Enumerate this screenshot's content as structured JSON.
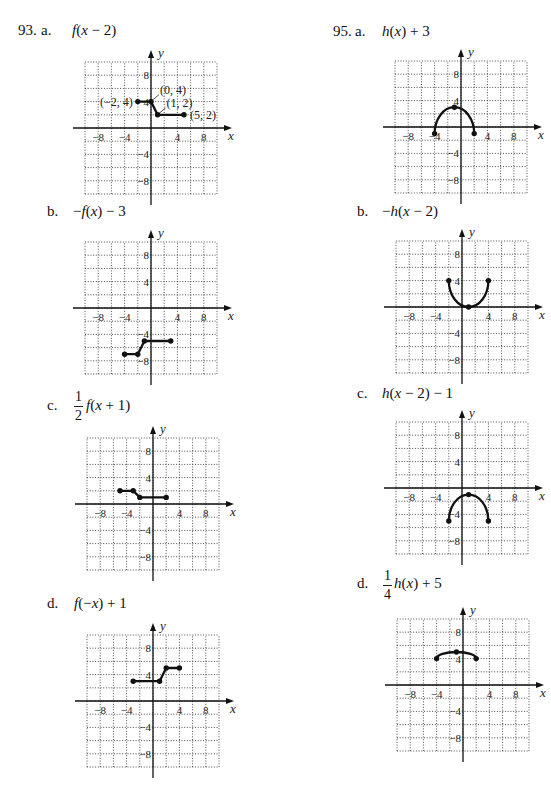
{
  "problems": [
    {
      "number": "93.",
      "parts": [
        {
          "label": "a.",
          "expression": "f(x − 2)"
        },
        {
          "label": "b.",
          "expression": "−f(x) − 3"
        },
        {
          "label": "c.",
          "coefficient": {
            "num": "1",
            "den": "2"
          },
          "expression": "f(x + 1)"
        },
        {
          "label": "d.",
          "expression": "f(−x) + 1"
        }
      ]
    },
    {
      "number": "95.",
      "parts": [
        {
          "label": "a.",
          "expression": "h(x) + 3"
        },
        {
          "label": "b.",
          "expression": "−h(x − 2)"
        },
        {
          "label": "c.",
          "expression": "h(x − 2) − 1"
        },
        {
          "label": "d.",
          "coefficient": {
            "num": "1",
            "den": "4"
          },
          "expression": "h(x) + 5"
        }
      ]
    }
  ],
  "chart_data": [
    {
      "id": "93a",
      "type": "line",
      "title": "f(x − 2)",
      "xlabel": "x",
      "ylabel": "y",
      "xlim": [
        -10,
        10
      ],
      "ylim": [
        -10,
        10
      ],
      "grid": true,
      "grid_step": 2,
      "x_ticks": [
        -8,
        -4,
        4,
        8
      ],
      "x_tick_labels": [
        "−8",
        "−4",
        "4",
        "8"
      ],
      "y_ticks": [
        8,
        4,
        -4,
        -8
      ],
      "y_tick_labels": [
        "8",
        "4",
        "−4",
        "−8"
      ],
      "series": [
        {
          "name": "f(x − 2)",
          "curve": "polyline",
          "points": [
            [
              -2,
              4
            ],
            [
              0,
              4
            ],
            [
              1,
              2
            ],
            [
              5,
              2
            ]
          ]
        }
      ],
      "annotations": [
        {
          "text": "(−2, 4)",
          "x": -2,
          "y": 4,
          "placement": "left"
        },
        {
          "text": "(0, 4)",
          "x": 0,
          "y": 4,
          "placement": "upper-right"
        },
        {
          "text": "(1, 2)",
          "x": 1,
          "y": 2,
          "placement": "upper-right"
        },
        {
          "text": "(5, 2)",
          "x": 5,
          "y": 2,
          "placement": "right"
        }
      ]
    },
    {
      "id": "93b",
      "type": "line",
      "title": "−f(x) − 3",
      "xlabel": "x",
      "ylabel": "y",
      "xlim": [
        -10,
        10
      ],
      "ylim": [
        -10,
        10
      ],
      "grid": true,
      "grid_step": 2,
      "x_ticks": [
        -8,
        -4,
        4,
        8
      ],
      "x_tick_labels": [
        "−8",
        "−4",
        "4",
        "8"
      ],
      "y_ticks": [
        8,
        4,
        -4,
        -8
      ],
      "y_tick_labels": [
        "8",
        "4",
        "−4",
        "−8"
      ],
      "series": [
        {
          "name": "−f(x) − 3",
          "curve": "polyline",
          "points": [
            [
              -4,
              -7
            ],
            [
              -2,
              -7
            ],
            [
              -1,
              -5
            ],
            [
              3,
              -5
            ]
          ]
        }
      ]
    },
    {
      "id": "93c",
      "type": "line",
      "title": "(1/2) f(x + 1)",
      "xlabel": "x",
      "ylabel": "y",
      "xlim": [
        -10,
        10
      ],
      "ylim": [
        -10,
        10
      ],
      "grid": true,
      "grid_step": 2,
      "x_ticks": [
        -8,
        -4,
        4,
        8
      ],
      "x_tick_labels": [
        "−8",
        "−4",
        "4",
        "8"
      ],
      "y_ticks": [
        8,
        4,
        -4,
        -8
      ],
      "y_tick_labels": [
        "8",
        "4",
        "−4",
        "−8"
      ],
      "series": [
        {
          "name": "(1/2) f(x + 1)",
          "curve": "polyline",
          "points": [
            [
              -5,
              2
            ],
            [
              -3,
              2
            ],
            [
              -2,
              1
            ],
            [
              2,
              1
            ]
          ]
        }
      ]
    },
    {
      "id": "93d",
      "type": "line",
      "title": "f(−x) + 1",
      "xlabel": "x",
      "ylabel": "y",
      "xlim": [
        -10,
        10
      ],
      "ylim": [
        -10,
        10
      ],
      "grid": true,
      "grid_step": 2,
      "x_ticks": [
        -8,
        -4,
        4,
        8
      ],
      "x_tick_labels": [
        "−8",
        "−4",
        "4",
        "8"
      ],
      "y_ticks": [
        8,
        4,
        -4,
        -8
      ],
      "y_tick_labels": [
        "8",
        "4",
        "−4",
        "−8"
      ],
      "series": [
        {
          "name": "f(−x) + 1",
          "curve": "polyline",
          "points": [
            [
              -3,
              3
            ],
            [
              1,
              3
            ],
            [
              2,
              5
            ],
            [
              4,
              5
            ]
          ]
        }
      ]
    },
    {
      "id": "95a",
      "type": "line",
      "title": "h(x) + 3",
      "xlabel": "x",
      "ylabel": "y",
      "xlim": [
        -10,
        10
      ],
      "ylim": [
        -10,
        10
      ],
      "grid": true,
      "grid_step": 2,
      "x_ticks": [
        -8,
        -4,
        4,
        8
      ],
      "x_tick_labels": [
        "−8",
        "−4",
        "4",
        "8"
      ],
      "y_ticks": [
        8,
        4,
        -4,
        -8
      ],
      "y_tick_labels": [
        "8",
        "4",
        "−4",
        "−8"
      ],
      "series": [
        {
          "name": "h(x) + 3",
          "curve": "semi-ellipse",
          "points": [
            [
              -4,
              -1
            ],
            [
              -1,
              3
            ],
            [
              2,
              -1
            ]
          ]
        }
      ]
    },
    {
      "id": "95b",
      "type": "line",
      "title": "−h(x − 2)",
      "xlabel": "x",
      "ylabel": "y",
      "xlim": [
        -10,
        10
      ],
      "ylim": [
        -10,
        10
      ],
      "grid": true,
      "grid_step": 2,
      "x_ticks": [
        -8,
        -4,
        4,
        8
      ],
      "x_tick_labels": [
        "−8",
        "−4",
        "4",
        "8"
      ],
      "y_ticks": [
        8,
        4,
        -4,
        -8
      ],
      "y_tick_labels": [
        "8",
        "4",
        "−4",
        "−8"
      ],
      "series": [
        {
          "name": "−h(x − 2)",
          "curve": "semi-ellipse",
          "points": [
            [
              -2,
              4
            ],
            [
              1,
              0
            ],
            [
              4,
              4
            ]
          ]
        }
      ]
    },
    {
      "id": "95c",
      "type": "line",
      "title": "h(x − 2) − 1",
      "xlabel": "x",
      "ylabel": "y",
      "xlim": [
        -10,
        10
      ],
      "ylim": [
        -10,
        10
      ],
      "grid": true,
      "grid_step": 2,
      "x_ticks": [
        -8,
        -4,
        4,
        8
      ],
      "x_tick_labels": [
        "−8",
        "−4",
        "4",
        "8"
      ],
      "y_ticks": [
        8,
        4,
        -4,
        -8
      ],
      "y_tick_labels": [
        "8",
        "4",
        "−4",
        "−8"
      ],
      "series": [
        {
          "name": "h(x − 2) − 1",
          "curve": "semi-ellipse",
          "points": [
            [
              -2,
              -5
            ],
            [
              1,
              -1
            ],
            [
              4,
              -5
            ]
          ]
        }
      ]
    },
    {
      "id": "95d",
      "type": "line",
      "title": "(1/4) h(x) + 5",
      "xlabel": "x",
      "ylabel": "y",
      "xlim": [
        -10,
        10
      ],
      "ylim": [
        -10,
        10
      ],
      "grid": true,
      "grid_step": 2,
      "x_ticks": [
        -8,
        -4,
        4,
        8
      ],
      "x_tick_labels": [
        "−8",
        "−4",
        "4",
        "8"
      ],
      "y_ticks": [
        8,
        4,
        -4,
        -8
      ],
      "y_tick_labels": [
        "8",
        "4",
        "−4",
        "−8"
      ],
      "series": [
        {
          "name": "(1/4) h(x) + 5",
          "curve": "semi-ellipse",
          "points": [
            [
              -4,
              4
            ],
            [
              -1,
              5
            ],
            [
              2,
              4
            ]
          ]
        }
      ]
    }
  ]
}
